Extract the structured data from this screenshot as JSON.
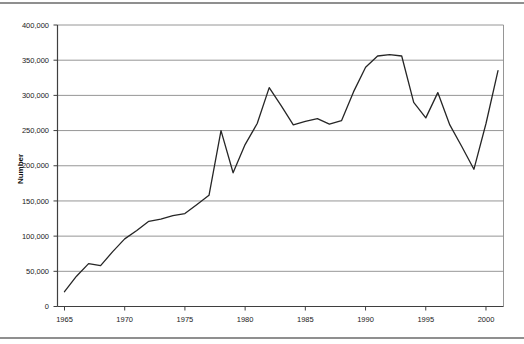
{
  "chart_data": {
    "type": "line",
    "title": "",
    "xlabel": "",
    "ylabel": "Number",
    "x": [
      1965,
      1966,
      1967,
      1968,
      1969,
      1970,
      1971,
      1972,
      1973,
      1974,
      1975,
      1976,
      1977,
      1978,
      1979,
      1980,
      1981,
      1982,
      1983,
      1984,
      1985,
      1986,
      1987,
      1988,
      1989,
      1990,
      1991,
      1992,
      1993,
      1994,
      1995,
      1996,
      1997,
      1998,
      1999,
      2000,
      2001
    ],
    "values": [
      21000,
      43000,
      61000,
      58000,
      78000,
      96000,
      108000,
      121000,
      124000,
      129000,
      132000,
      145000,
      158000,
      250000,
      190000,
      230000,
      260000,
      311000,
      285000,
      258000,
      263000,
      267000,
      259000,
      264000,
      305000,
      340000,
      356000,
      358000,
      356000,
      290000,
      268000,
      304000,
      258000,
      227000,
      195000,
      260000,
      335000
    ],
    "ylim": [
      0,
      400000
    ],
    "yticks": [
      0,
      50000,
      100000,
      150000,
      200000,
      250000,
      300000,
      350000,
      400000
    ],
    "xticks": [
      1965,
      1970,
      1975,
      1980,
      1985,
      1990,
      1995,
      2000
    ],
    "grid": true,
    "legend": null,
    "colors": {
      "line": "#262626",
      "grid": "#8a8a8a",
      "axis": "#3f3f3f",
      "text": "#1a1a1a",
      "rule": "#8f8f8f"
    }
  }
}
